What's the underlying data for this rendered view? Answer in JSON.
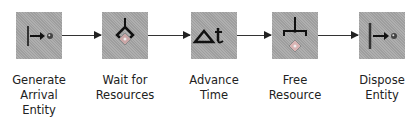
{
  "diagram": {
    "steps": [
      {
        "label": "Generate Arrival Entity",
        "lines": [
          "Generate",
          "Arrival",
          "Entity"
        ],
        "icon": "create-entity-icon"
      },
      {
        "label": "Wait for Resources",
        "lines": [
          "Wait for",
          "Resources"
        ],
        "icon": "seize-resource-icon"
      },
      {
        "label": "Advance Time",
        "lines": [
          "Advance",
          "Time"
        ],
        "icon": "delta-t-icon"
      },
      {
        "label": "Free Resource",
        "lines": [
          "Free",
          "Resource"
        ],
        "icon": "release-resource-icon"
      },
      {
        "label": "Dispose Entity",
        "lines": [
          "Dispose",
          "Entity"
        ],
        "icon": "dispose-entity-icon"
      }
    ],
    "colors": {
      "box": "#a6a6a6",
      "line": "#222222",
      "text": "#222222"
    }
  }
}
